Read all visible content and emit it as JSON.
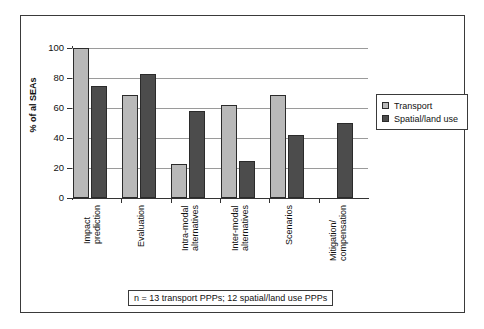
{
  "chart_data": {
    "type": "bar",
    "title": "",
    "subtitle": "",
    "xlabel": "",
    "ylabel": "% of al SEAs",
    "ylim": [
      0,
      100
    ],
    "yticks": [
      0,
      20,
      40,
      60,
      80,
      100
    ],
    "ytick_labels": [
      "0",
      "20",
      "40",
      "60",
      "80",
      "100"
    ],
    "grid": true,
    "legend_position": "right",
    "categories": [
      "Impact prediction",
      "Evaluation",
      "Intra-modal alternatives",
      "Inter-modal alternatives",
      "Scenarios",
      "Mitigation/compensation"
    ],
    "category_lines": [
      [
        "Impact",
        "prediction"
      ],
      [
        "Evaluation"
      ],
      [
        "Intra-modal",
        "alternatives"
      ],
      [
        "Inter-modal",
        "alternatives"
      ],
      [
        "Scenarios"
      ],
      [
        "Mitigation/",
        "compensation"
      ]
    ],
    "series": [
      {
        "name": "Transport",
        "color": "#b9b9b9",
        "values": [
          100,
          69,
          23,
          62,
          69,
          null
        ]
      },
      {
        "name": "Spatial/land use",
        "color": "#4c4c4c",
        "values": [
          75,
          83,
          58,
          25,
          42,
          50
        ]
      }
    ],
    "annotations": [
      "n = 13 transport PPPs; 12 spatial/land use PPPs"
    ]
  },
  "legend": {
    "items": [
      {
        "label": "Transport",
        "color": "#b9b9b9"
      },
      {
        "label": "Spatial/land use",
        "color": "#4c4c4c"
      }
    ]
  },
  "footnote": {
    "text": "n = 13 transport PPPs; 12 spatial/land use PPPs"
  },
  "axis": {
    "y_title": "% of al SEAs"
  },
  "colors": {
    "transport": "#b9b9b9",
    "spatial": "#4c4c4c",
    "frame": "#3a3a3a",
    "gridline": "#9a9a9a",
    "text": "#111111",
    "background": "#ffffff"
  }
}
